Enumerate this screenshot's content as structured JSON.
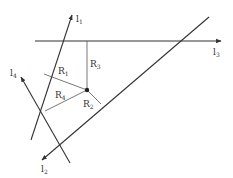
{
  "diagram": {
    "lines": [
      {
        "id": "l1",
        "label": "l",
        "sub": "1"
      },
      {
        "id": "l2",
        "label": "l",
        "sub": "2"
      },
      {
        "id": "l3",
        "label": "l",
        "sub": "3"
      },
      {
        "id": "l4",
        "label": "l",
        "sub": "4"
      }
    ],
    "segments": [
      {
        "id": "R1",
        "label": "R",
        "sub": "1"
      },
      {
        "id": "R2",
        "label": "R",
        "sub": "2"
      },
      {
        "id": "R3",
        "label": "R",
        "sub": "3"
      },
      {
        "id": "R4",
        "label": "R",
        "sub": "4"
      }
    ],
    "point": {
      "label": ""
    },
    "colors": {
      "ink": "#333333",
      "background": "#ffffff"
    }
  }
}
